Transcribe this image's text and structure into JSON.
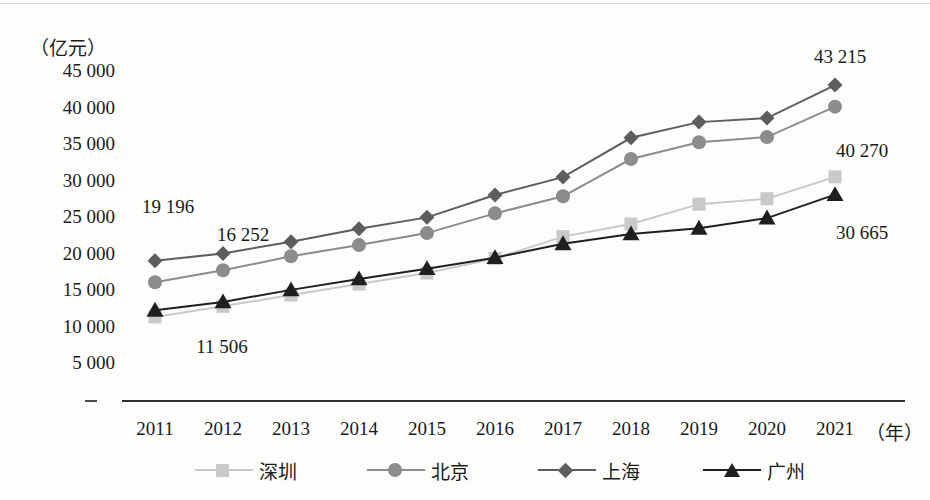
{
  "axis": {
    "y_unit": "（亿元）",
    "y_ticks": [
      "45 000",
      "40 000",
      "35 000",
      "30 000",
      "25 000",
      "20 000",
      "15 000",
      "10 000",
      "5 000"
    ],
    "x_unit": "（年）"
  },
  "legend": [
    {
      "label": "深圳",
      "marker": "square-marker-icon",
      "color": "#c9c9c9"
    },
    {
      "label": "北京",
      "marker": "circle-marker-icon",
      "color": "#8c8c8c"
    },
    {
      "label": "上海",
      "marker": "diamond-marker-icon",
      "color": "#5d5d5d"
    },
    {
      "label": "广州",
      "marker": "triangle-marker-icon",
      "color": "#1f1f1f"
    }
  ],
  "annotations": [
    {
      "text": "19 196",
      "series": "上海",
      "year": "2011"
    },
    {
      "text": "16 252",
      "series": "北京",
      "year": "2012"
    },
    {
      "text": "11 506",
      "series": "深圳",
      "year": "2011"
    },
    {
      "text": "43 215",
      "series": "上海",
      "year": "2021"
    },
    {
      "text": "40 270",
      "series": "北京",
      "year": "2021"
    },
    {
      "text": "30 665",
      "series": "深圳",
      "year": "2021"
    }
  ],
  "chart_data": {
    "type": "line",
    "title": "",
    "xlabel": "（年）",
    "ylabel": "（亿元）",
    "categories": [
      "2011",
      "2012",
      "2013",
      "2014",
      "2015",
      "2016",
      "2017",
      "2018",
      "2019",
      "2020",
      "2021"
    ],
    "ylim": [
      0,
      45000
    ],
    "ytick_values": [
      5000,
      10000,
      15000,
      20000,
      25000,
      30000,
      35000,
      40000,
      45000
    ],
    "grid": false,
    "legend_position": "bottom",
    "series": [
      {
        "name": "深圳",
        "marker": "square",
        "color": "#c9c9c9",
        "values": [
          11506,
          12950,
          14500,
          16000,
          17500,
          19500,
          22490,
          24220,
          26930,
          27670,
          30665
        ]
      },
      {
        "name": "北京",
        "marker": "circle",
        "color": "#8c8c8c",
        "values": [
          16252,
          17880,
          19800,
          21330,
          22970,
          25670,
          28000,
          33100,
          35400,
          36100,
          40270
        ]
      },
      {
        "name": "上海",
        "marker": "diamond",
        "color": "#5d5d5d",
        "values": [
          19196,
          20180,
          21800,
          23560,
          25120,
          28180,
          30630,
          36010,
          38150,
          38700,
          43215
        ]
      },
      {
        "name": "广州",
        "marker": "triangle",
        "color": "#1f1f1f",
        "values": [
          12400,
          13550,
          15200,
          16700,
          18100,
          19610,
          21500,
          22860,
          23630,
          25020,
          28230
        ]
      }
    ]
  }
}
